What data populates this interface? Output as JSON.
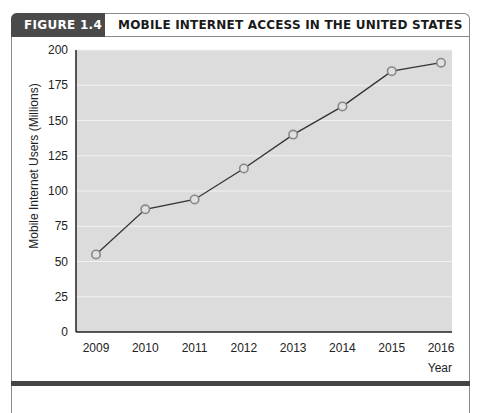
{
  "figure": {
    "label": "FIGURE 1.4",
    "title": "MOBILE INTERNET ACCESS IN THE UNITED STATES",
    "header_label_bg": "#4a4a4a",
    "plot_bg": "#dcdcdc",
    "line_color": "#333333",
    "marker_fill": "#e0e0e0",
    "marker_stroke": "#888888"
  },
  "chart_data": {
    "type": "line",
    "title": "MOBILE INTERNET ACCESS IN THE UNITED STATES",
    "xlabel": "Year",
    "ylabel": "Mobile Internet Users (Millions)",
    "categories": [
      "2009",
      "2010",
      "2011",
      "2012",
      "2013",
      "2014",
      "2015",
      "2016"
    ],
    "series": [
      {
        "name": "Mobile Internet Users",
        "values": [
          55,
          87,
          94,
          116,
          140,
          160,
          185,
          191
        ]
      }
    ],
    "yticks": [
      0,
      25,
      50,
      75,
      100,
      125,
      150,
      175,
      200
    ],
    "ylim": [
      0,
      200
    ],
    "grid": true,
    "legend": "none"
  }
}
